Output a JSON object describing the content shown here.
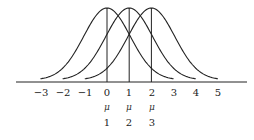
{
  "chart_data": {
    "type": "line",
    "title": "",
    "xlabel": "",
    "ylabel": "",
    "x_ticks": [
      "-3",
      "-2",
      "-1",
      "0",
      "1",
      "2",
      "3",
      "4",
      "5"
    ],
    "xlim": [
      -3.5,
      6
    ],
    "grid": false,
    "legend": "none",
    "series": [
      {
        "name": "normal curve centered at mu1",
        "mean": 0,
        "x_range": [
          -3,
          3
        ],
        "vertical_line_at": 0
      },
      {
        "name": "normal curve centered at mu2",
        "mean": 1,
        "x_range": [
          -2,
          4
        ],
        "vertical_line_at": 1
      },
      {
        "name": "normal curve centered at mu3",
        "mean": 2,
        "x_range": [
          -1,
          5
        ],
        "vertical_line_at": 2
      }
    ],
    "annotations": [
      {
        "x": 0,
        "label": "μ",
        "subscript": "1"
      },
      {
        "x": 1,
        "label": "μ",
        "subscript": "2"
      },
      {
        "x": 2,
        "label": "μ",
        "subscript": "3"
      }
    ]
  },
  "axis": {
    "ticks": [
      "−3",
      "−2",
      "−1",
      "0",
      "1",
      "2",
      "3",
      "4",
      "5"
    ]
  },
  "mu_labels": [
    {
      "symbol": "μ",
      "index": "1"
    },
    {
      "symbol": "μ",
      "index": "2"
    },
    {
      "symbol": "μ",
      "index": "3"
    }
  ]
}
